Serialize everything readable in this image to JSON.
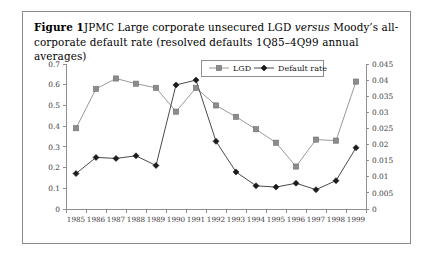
{
  "figure": {
    "label": "Figure 1",
    "caption_part1": "JPMC Large corporate unsecured LGD ",
    "caption_italic": "versus",
    "caption_part2": " Moody’s all-corporate default rate (resolved defaults 1Q85–4Q99 annual averages)"
  },
  "colors": {
    "lgd_line": "#9a9a9a",
    "lgd_marker": "#8c8c8c",
    "default_line": "#4a4a4a",
    "default_marker": "#1c1c1c",
    "axis": "#8e8e8e",
    "frame": "#8a8a8a",
    "background": "#ffffff"
  },
  "chart_data": {
    "type": "line",
    "title": "",
    "xlabel": "",
    "ylabel": "",
    "grid": false,
    "legend_position": "top-center",
    "categories": [
      "1985",
      "1986",
      "1987",
      "1988",
      "1989",
      "1990",
      "1991",
      "1992",
      "1993",
      "1994",
      "1995",
      "1996",
      "1997",
      "1998",
      "1999"
    ],
    "left_axis": {
      "label": "",
      "ylim": [
        0,
        0.7
      ],
      "tick_step": 0.1,
      "ticks": [
        "0",
        "0.1",
        "0.2",
        "0.3",
        "0.4",
        "0.5",
        "0.6",
        "0.7"
      ],
      "tick_values": [
        0,
        0.1,
        0.2,
        0.3,
        0.4,
        0.5,
        0.6,
        0.7
      ]
    },
    "right_axis": {
      "label": "",
      "ylim": [
        0,
        0.045
      ],
      "tick_step": 0.005,
      "ticks": [
        "0",
        "0.005",
        "0.01",
        "0.015",
        "0.02",
        "0.025",
        "0.03",
        "0.035",
        "0.04",
        "0.045"
      ],
      "tick_values": [
        0,
        0.005,
        0.01,
        0.015,
        0.02,
        0.025,
        0.03,
        0.035,
        0.04,
        0.045
      ]
    },
    "series": [
      {
        "name": "LGD",
        "axis": "left",
        "marker": "square",
        "values": [
          0.39,
          0.58,
          0.63,
          0.605,
          0.585,
          0.47,
          0.585,
          0.5,
          0.445,
          0.385,
          0.32,
          0.205,
          0.335,
          0.33,
          0.615
        ]
      },
      {
        "name": "Default rate",
        "axis": "right",
        "marker": "diamond",
        "values": [
          0.011,
          0.016,
          0.0157,
          0.0165,
          0.0135,
          0.0385,
          0.04,
          0.021,
          0.0115,
          0.0072,
          0.0068,
          0.008,
          0.006,
          0.0088,
          0.019
        ]
      }
    ]
  }
}
